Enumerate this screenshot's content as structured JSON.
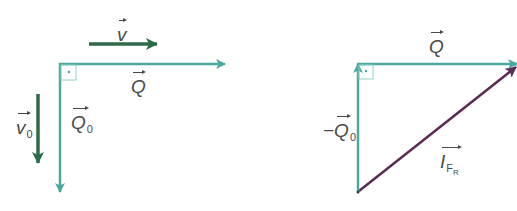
{
  "diagram": {
    "type": "vector-diagram",
    "colors": {
      "teal": "#4aa89e",
      "dark_green": "#2e6b4a",
      "purple": "#5b2a55",
      "label": "#4a4a4a"
    },
    "left": {
      "vectors": [
        {
          "name": "v",
          "label": "v",
          "direction": "right",
          "color": "dark_green"
        },
        {
          "name": "Q",
          "label": "Q",
          "direction": "right",
          "color": "teal"
        },
        {
          "name": "Q0",
          "label": "Q",
          "subscript": "0",
          "direction": "down",
          "color": "teal"
        },
        {
          "name": "v0",
          "label": "v",
          "subscript": "0",
          "direction": "down",
          "color": "dark_green"
        }
      ],
      "right_angle_marker": true
    },
    "right": {
      "vectors": [
        {
          "name": "Q",
          "label": "Q",
          "direction": "right",
          "color": "teal"
        },
        {
          "name": "-Q0",
          "label": "−Q",
          "subscript": "0",
          "direction": "up",
          "color": "teal"
        },
        {
          "name": "I_FR",
          "label": "I",
          "subscript": "F",
          "subsubscript": "R",
          "direction": "up-right",
          "color": "purple"
        }
      ],
      "right_angle_marker": true
    }
  },
  "labels": {
    "v": "v",
    "Q_left": "Q",
    "Q0_main": "Q",
    "Q0_sub": "0",
    "v0_main": "v",
    "v0_sub": "0",
    "Q_right": "Q",
    "negQ0_main": "−Q",
    "negQ0_sub": "0",
    "IFR_main": "I",
    "IFR_sub": "F",
    "IFR_subsub": "R"
  }
}
